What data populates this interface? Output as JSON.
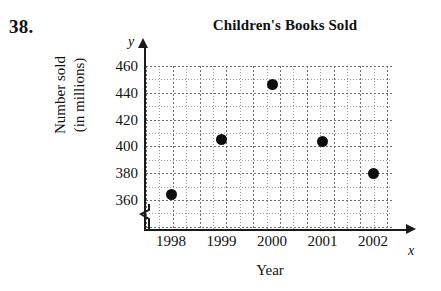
{
  "exercise_number": "38.",
  "top_partial_text": "",
  "chart_data": {
    "type": "scatter",
    "title": "Children's Books Sold",
    "xlabel": "Year",
    "ylabel_line1": "Number sold",
    "ylabel_line2": "(in millions)",
    "x_axis_letter": "x",
    "y_axis_letter": "y",
    "categories": [
      "1998",
      "1999",
      "2000",
      "2001",
      "2002"
    ],
    "x": [
      1998,
      1999,
      2000,
      2001,
      2002
    ],
    "values": [
      364,
      405,
      446,
      404,
      380
    ],
    "points": [
      {
        "x": "1998",
        "y": 364
      },
      {
        "x": "1999",
        "y": 405
      },
      {
        "x": "2000",
        "y": 446
      },
      {
        "x": "2001",
        "y": 404
      },
      {
        "x": "2002",
        "y": 380
      }
    ],
    "y_ticks": [
      "460",
      "440",
      "420",
      "400",
      "380",
      "360"
    ],
    "y_tick_values": [
      460,
      440,
      420,
      400,
      380,
      360
    ],
    "ylim": [
      355,
      465
    ],
    "xlim": [
      1997.5,
      2002.8
    ],
    "grid": true,
    "y_axis_break": true,
    "legend": null,
    "marker_color": "#0d0d0d",
    "axis_color": "#1a1a1a",
    "grid_color": "#9a9a9a"
  }
}
